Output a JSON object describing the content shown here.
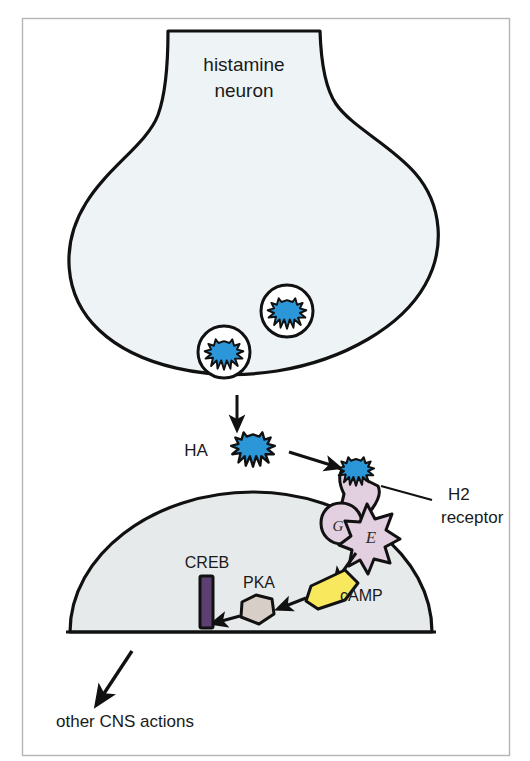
{
  "figure": {
    "title_label": "histamine neuron",
    "frame_color": "#b5b5b5",
    "background_color": "#ffffff"
  },
  "presynaptic": {
    "name": "histamine neuron terminal",
    "label_line1": "histamine",
    "label_line2": "neuron",
    "fill_color": "#eef4f6",
    "stroke_color": "#111111",
    "vesicles": [
      {
        "id": "vesicle-docked",
        "state": "docked-fusing"
      },
      {
        "id": "vesicle-free",
        "state": "free"
      }
    ]
  },
  "neurotransmitter": {
    "abbrev_label": "HA",
    "full_name": "histamine",
    "color": "#2b96d8",
    "stroke_color": "#111111"
  },
  "receptor": {
    "label_line1": "H2",
    "label_line2": "receptor",
    "fill_color": "#e2cfe0",
    "stroke_color": "#111111",
    "g_protein_label": "G",
    "enzyme_label": "E"
  },
  "postsynaptic": {
    "name": "postsynaptic cell",
    "fill_color": "#e7eaea",
    "stroke_color": "#111111"
  },
  "signaling": [
    {
      "id": "camp",
      "label": "cAMP",
      "color": "#f7e85e",
      "stroke": "#111111"
    },
    {
      "id": "pka",
      "label": "PKA",
      "color": "#d6cec7",
      "stroke": "#111111"
    },
    {
      "id": "creb",
      "label": "CREB",
      "color": "#5c4072",
      "stroke": "#111111"
    }
  ],
  "outcome": {
    "label": "other CNS actions"
  },
  "arrows": [
    {
      "id": "arrow-release",
      "from": "terminal",
      "to": "HA"
    },
    {
      "id": "arrow-ha-to-receptor",
      "from": "HA",
      "to": "H2 receptor"
    },
    {
      "id": "arrow-enzyme-to-camp",
      "from": "enzyme",
      "to": "cAMP"
    },
    {
      "id": "arrow-camp-to-pka",
      "from": "cAMP",
      "to": "PKA"
    },
    {
      "id": "arrow-pka-to-creb",
      "from": "PKA",
      "to": "CREB"
    },
    {
      "id": "arrow-to-cns",
      "from": "postsynaptic cell",
      "to": "other CNS actions"
    }
  ]
}
